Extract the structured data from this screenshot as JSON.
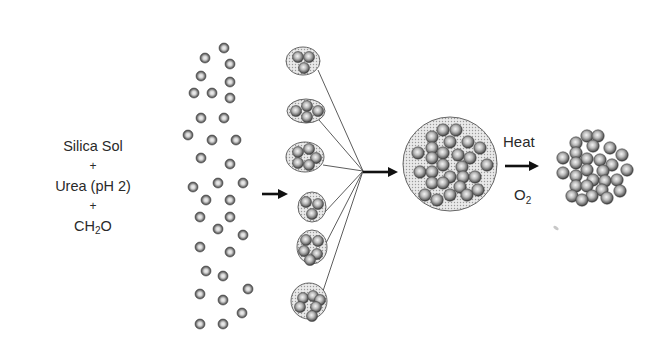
{
  "reactants": {
    "line1": "Silica Sol",
    "plus1": "+",
    "line2": "Urea (pH 2)",
    "plus2": "+",
    "line3_main": "CH",
    "line3_sub": "2",
    "line3_tail": "O"
  },
  "conditions": {
    "above_arrow": "Heat",
    "below_arrow_main": "O",
    "below_arrow_sub": "2"
  },
  "colors": {
    "particle_ring": "#4a4a4a",
    "particle_mid": "#8a8a8a",
    "particle_center": "#e6e6e6",
    "cluster_fill": "#d8d8d8",
    "cluster_stroke": "#555555",
    "line": "#4a4a4a",
    "arrow": "#111111",
    "text": "#2a2a2a"
  },
  "stages": {
    "dispersed_particles": [
      [
        224,
        48
      ],
      [
        205,
        58
      ],
      [
        230,
        64
      ],
      [
        201,
        76
      ],
      [
        230,
        82
      ],
      [
        194,
        93
      ],
      [
        212,
        93
      ],
      [
        230,
        98
      ],
      [
        201,
        118
      ],
      [
        224,
        118
      ],
      [
        188,
        135
      ],
      [
        212,
        140
      ],
      [
        236,
        140
      ],
      [
        201,
        158
      ],
      [
        230,
        164
      ],
      [
        193,
        187
      ],
      [
        218,
        183
      ],
      [
        243,
        183
      ],
      [
        206,
        200
      ],
      [
        230,
        200
      ],
      [
        200,
        217
      ],
      [
        230,
        217
      ],
      [
        218,
        229
      ],
      [
        243,
        235
      ],
      [
        200,
        247
      ],
      [
        230,
        252
      ],
      [
        206,
        271
      ],
      [
        223,
        276
      ],
      [
        248,
        289
      ],
      [
        200,
        294
      ],
      [
        223,
        300
      ],
      [
        242,
        313
      ],
      [
        200,
        324
      ],
      [
        223,
        324
      ]
    ],
    "small_clusters": [
      {
        "cx": 303,
        "cy": 61,
        "rx": 17,
        "ry": 14,
        "particles": [
          [
            298,
            57
          ],
          [
            309,
            57
          ],
          [
            304,
            68
          ]
        ]
      },
      {
        "cx": 306,
        "cy": 111,
        "rx": 19,
        "ry": 12,
        "particles": [
          [
            296,
            111
          ],
          [
            307,
            106
          ],
          [
            318,
            111
          ],
          [
            307,
            117
          ]
        ]
      },
      {
        "cx": 305,
        "cy": 157,
        "rx": 19,
        "ry": 15,
        "particles": [
          [
            298,
            152
          ],
          [
            309,
            149
          ],
          [
            316,
            158
          ],
          [
            298,
            163
          ],
          [
            309,
            165
          ]
        ]
      },
      {
        "cx": 312,
        "cy": 207,
        "rx": 14,
        "ry": 15,
        "particles": [
          [
            306,
            202
          ],
          [
            318,
            204
          ],
          [
            312,
            214
          ]
        ]
      },
      {
        "cx": 312,
        "cy": 247,
        "rx": 15,
        "ry": 17,
        "particles": [
          [
            306,
            240
          ],
          [
            318,
            241
          ],
          [
            304,
            251
          ],
          [
            317,
            254
          ],
          [
            310,
            260
          ]
        ]
      },
      {
        "cx": 309,
        "cy": 301,
        "rx": 18,
        "ry": 18,
        "particles": [
          [
            303,
            298
          ],
          [
            313,
            296
          ],
          [
            320,
            300
          ],
          [
            300,
            307
          ],
          [
            316,
            307
          ],
          [
            312,
            316
          ]
        ]
      }
    ],
    "convergence_point": [
      363,
      171
    ],
    "line_starts": [
      [
        318,
        70
      ],
      [
        319,
        120
      ],
      [
        323,
        165
      ],
      [
        325,
        212
      ],
      [
        325,
        245
      ],
      [
        322,
        294
      ]
    ],
    "aggregate_circle": {
      "cx": 450,
      "cy": 164,
      "r": 47,
      "particles": [
        [
          443,
          130
        ],
        [
          456,
          130
        ],
        [
          432,
          137
        ],
        [
          450,
          142
        ],
        [
          468,
          142
        ],
        [
          432,
          148
        ],
        [
          480,
          148
        ],
        [
          418,
          153
        ],
        [
          443,
          153
        ],
        [
          458,
          155
        ],
        [
          470,
          158
        ],
        [
          432,
          158
        ],
        [
          487,
          165
        ],
        [
          443,
          165
        ],
        [
          462,
          167
        ],
        [
          420,
          172
        ],
        [
          432,
          172
        ],
        [
          450,
          177
        ],
        [
          463,
          177
        ],
        [
          475,
          177
        ],
        [
          432,
          183
        ],
        [
          443,
          183
        ],
        [
          460,
          187
        ],
        [
          478,
          190
        ],
        [
          425,
          195
        ],
        [
          450,
          195
        ],
        [
          467,
          195
        ],
        [
          437,
          200
        ]
      ]
    },
    "final_cluster": {
      "particles": [
        [
          587,
          136
        ],
        [
          598,
          136
        ],
        [
          576,
          143
        ],
        [
          593,
          146
        ],
        [
          610,
          148
        ],
        [
          576,
          153
        ],
        [
          622,
          155
        ],
        [
          563,
          158
        ],
        [
          587,
          159
        ],
        [
          600,
          160
        ],
        [
          612,
          165
        ],
        [
          576,
          163
        ],
        [
          627,
          170
        ],
        [
          563,
          173
        ],
        [
          587,
          170
        ],
        [
          603,
          171
        ],
        [
          576,
          176
        ],
        [
          593,
          180
        ],
        [
          605,
          181
        ],
        [
          617,
          180
        ],
        [
          576,
          186
        ],
        [
          587,
          186
        ],
        [
          602,
          190
        ],
        [
          620,
          191
        ],
        [
          572,
          196
        ],
        [
          592,
          196
        ],
        [
          607,
          198
        ],
        [
          582,
          200
        ]
      ]
    },
    "arrows": [
      {
        "x1": 262,
        "y1": 194,
        "x2": 290,
        "y2": 194
      },
      {
        "x1": 363,
        "y1": 172,
        "x2": 400,
        "y2": 172
      },
      {
        "x1": 505,
        "y1": 166,
        "x2": 541,
        "y2": 166
      }
    ],
    "smudge": [
      556,
      228
    ]
  }
}
